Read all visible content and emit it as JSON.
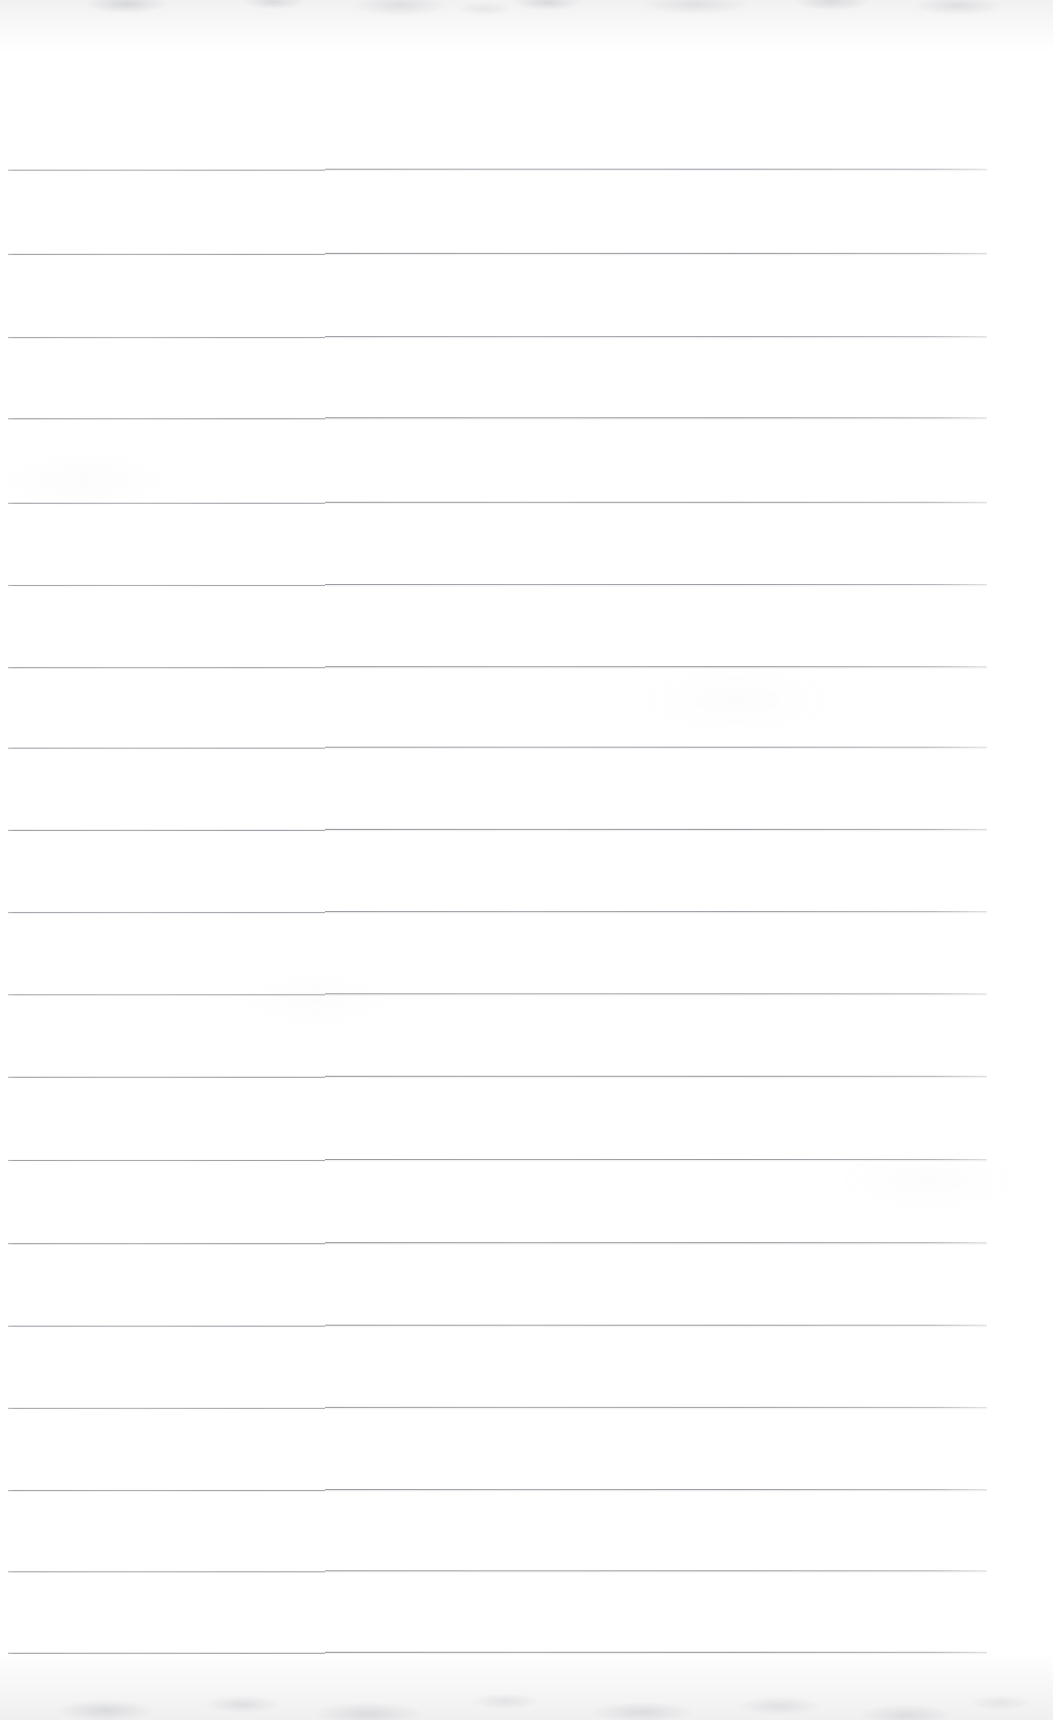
{
  "document": {
    "type": "scanned-lined-paper",
    "title": "Blank ruled notebook page (scan)",
    "page_width": 1053,
    "page_height": 1720,
    "background_color": "#ffffff",
    "text_content": "",
    "has_handwriting": false,
    "has_printed_text": false
  },
  "ruling": {
    "line_color": "#8b8d95",
    "line_thickness_px": 1,
    "line_count": 19,
    "line_spacing_px": 82.4,
    "first_line_y": 170,
    "last_line_y": 1653,
    "line_start_x": 8,
    "line_end_x": 987,
    "seam_x": 325,
    "seam_step_px": 1,
    "line_y_positions": [
      170,
      254,
      337,
      418,
      503,
      585,
      667,
      748,
      830,
      912,
      994,
      1077,
      1160,
      1243,
      1326,
      1408,
      1490,
      1571,
      1653
    ]
  },
  "artifacts": {
    "top_edge_noise": "faint gray mottling band along the top edge",
    "bottom_edge_noise": "faint gray mottling band along the bottom edge",
    "scan_seam": "subtle vertical discontinuity where each rule steps up ~1px"
  }
}
